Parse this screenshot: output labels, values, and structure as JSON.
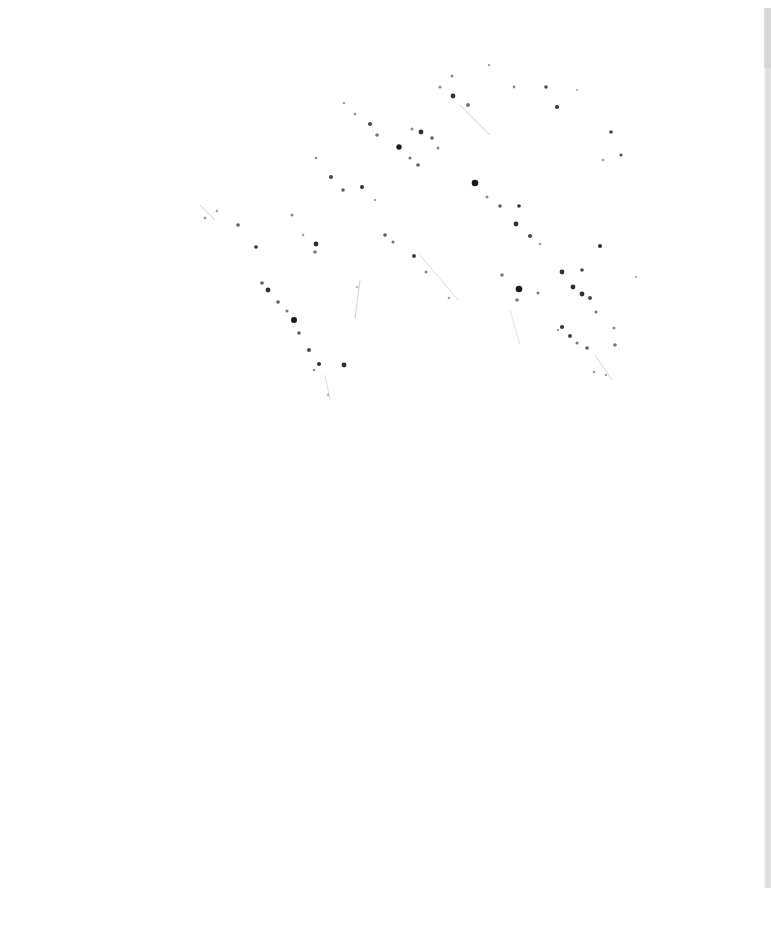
{
  "page": {
    "background": "#ffffff",
    "edge_color": "#dcdcdc",
    "ink_color": "#1a1a1a",
    "content_note": "Blank scanned page with faint ink bleed-through speckles; no legible text"
  },
  "speckles": [
    {
      "x": 452,
      "y": 76,
      "r": 1.5,
      "o": 0.5
    },
    {
      "x": 489,
      "y": 65,
      "r": 1.2,
      "o": 0.4
    },
    {
      "x": 514,
      "y": 87,
      "r": 1.4,
      "o": 0.5
    },
    {
      "x": 546,
      "y": 87,
      "r": 1.8,
      "o": 0.8
    },
    {
      "x": 557,
      "y": 107,
      "r": 2.0,
      "o": 0.9
    },
    {
      "x": 577,
      "y": 90,
      "r": 1.2,
      "o": 0.3
    },
    {
      "x": 440,
      "y": 87,
      "r": 1.5,
      "o": 0.5
    },
    {
      "x": 453,
      "y": 96,
      "r": 2.4,
      "o": 0.9
    },
    {
      "x": 468,
      "y": 105,
      "r": 2.0,
      "o": 0.6
    },
    {
      "x": 344,
      "y": 103,
      "r": 1.2,
      "o": 0.4
    },
    {
      "x": 355,
      "y": 114,
      "r": 1.3,
      "o": 0.5
    },
    {
      "x": 370,
      "y": 124,
      "r": 2.0,
      "o": 0.8
    },
    {
      "x": 377,
      "y": 135,
      "r": 1.8,
      "o": 0.6
    },
    {
      "x": 399,
      "y": 147,
      "r": 2.7,
      "o": 1.0
    },
    {
      "x": 412,
      "y": 129,
      "r": 1.5,
      "o": 0.5
    },
    {
      "x": 421,
      "y": 132,
      "r": 2.4,
      "o": 0.9
    },
    {
      "x": 432,
      "y": 138,
      "r": 1.8,
      "o": 0.7
    },
    {
      "x": 438,
      "y": 148,
      "r": 1.5,
      "o": 0.5
    },
    {
      "x": 410,
      "y": 158,
      "r": 1.6,
      "o": 0.6
    },
    {
      "x": 418,
      "y": 165,
      "r": 1.8,
      "o": 0.7
    },
    {
      "x": 611,
      "y": 132,
      "r": 1.8,
      "o": 0.8
    },
    {
      "x": 621,
      "y": 155,
      "r": 1.5,
      "o": 0.8
    },
    {
      "x": 603,
      "y": 160,
      "r": 1.3,
      "o": 0.4
    },
    {
      "x": 316,
      "y": 158,
      "r": 1.3,
      "o": 0.5
    },
    {
      "x": 331,
      "y": 177,
      "r": 2.0,
      "o": 0.8
    },
    {
      "x": 343,
      "y": 190,
      "r": 1.8,
      "o": 0.7
    },
    {
      "x": 362,
      "y": 187,
      "r": 2.0,
      "o": 0.9
    },
    {
      "x": 375,
      "y": 200,
      "r": 1.3,
      "o": 0.4
    },
    {
      "x": 475,
      "y": 183,
      "r": 3.3,
      "o": 1.0
    },
    {
      "x": 487,
      "y": 197,
      "r": 1.5,
      "o": 0.5
    },
    {
      "x": 500,
      "y": 206,
      "r": 1.8,
      "o": 0.7
    },
    {
      "x": 519,
      "y": 206,
      "r": 1.8,
      "o": 0.9
    },
    {
      "x": 516,
      "y": 224,
      "r": 2.4,
      "o": 0.9
    },
    {
      "x": 530,
      "y": 236,
      "r": 2.0,
      "o": 0.8
    },
    {
      "x": 540,
      "y": 244,
      "r": 1.3,
      "o": 0.4
    },
    {
      "x": 600,
      "y": 246,
      "r": 2.0,
      "o": 0.9
    },
    {
      "x": 205,
      "y": 218,
      "r": 1.5,
      "o": 0.4
    },
    {
      "x": 217,
      "y": 211,
      "r": 1.3,
      "o": 0.4
    },
    {
      "x": 238,
      "y": 225,
      "r": 1.8,
      "o": 0.7
    },
    {
      "x": 256,
      "y": 247,
      "r": 1.8,
      "o": 0.9
    },
    {
      "x": 292,
      "y": 215,
      "r": 1.5,
      "o": 0.5
    },
    {
      "x": 303,
      "y": 235,
      "r": 1.3,
      "o": 0.4
    },
    {
      "x": 316,
      "y": 244,
      "r": 2.4,
      "o": 0.9
    },
    {
      "x": 315,
      "y": 252,
      "r": 1.8,
      "o": 0.6
    },
    {
      "x": 385,
      "y": 235,
      "r": 1.8,
      "o": 0.7
    },
    {
      "x": 393,
      "y": 242,
      "r": 1.5,
      "o": 0.6
    },
    {
      "x": 414,
      "y": 256,
      "r": 2.0,
      "o": 0.8
    },
    {
      "x": 426,
      "y": 272,
      "r": 1.5,
      "o": 0.5
    },
    {
      "x": 262,
      "y": 283,
      "r": 1.8,
      "o": 0.7
    },
    {
      "x": 268,
      "y": 290,
      "r": 2.4,
      "o": 0.9
    },
    {
      "x": 278,
      "y": 302,
      "r": 1.8,
      "o": 0.7
    },
    {
      "x": 287,
      "y": 311,
      "r": 1.5,
      "o": 0.6
    },
    {
      "x": 294,
      "y": 320,
      "r": 3.0,
      "o": 1.0
    },
    {
      "x": 299,
      "y": 333,
      "r": 1.8,
      "o": 0.7
    },
    {
      "x": 309,
      "y": 350,
      "r": 2.0,
      "o": 0.8
    },
    {
      "x": 319,
      "y": 364,
      "r": 2.0,
      "o": 0.9
    },
    {
      "x": 314,
      "y": 370,
      "r": 1.3,
      "o": 0.5
    },
    {
      "x": 344,
      "y": 365,
      "r": 2.4,
      "o": 0.9
    },
    {
      "x": 328,
      "y": 395,
      "r": 1.2,
      "o": 0.3
    },
    {
      "x": 357,
      "y": 287,
      "r": 1.2,
      "o": 0.3
    },
    {
      "x": 502,
      "y": 275,
      "r": 1.8,
      "o": 0.6
    },
    {
      "x": 519,
      "y": 289,
      "r": 3.3,
      "o": 1.0
    },
    {
      "x": 517,
      "y": 300,
      "r": 1.8,
      "o": 0.6
    },
    {
      "x": 538,
      "y": 293,
      "r": 1.5,
      "o": 0.6
    },
    {
      "x": 562,
      "y": 272,
      "r": 2.4,
      "o": 0.9
    },
    {
      "x": 582,
      "y": 270,
      "r": 1.8,
      "o": 0.8
    },
    {
      "x": 573,
      "y": 287,
      "r": 2.4,
      "o": 0.9
    },
    {
      "x": 582,
      "y": 294,
      "r": 2.4,
      "o": 0.9
    },
    {
      "x": 590,
      "y": 298,
      "r": 2.0,
      "o": 0.8
    },
    {
      "x": 596,
      "y": 312,
      "r": 1.5,
      "o": 0.6
    },
    {
      "x": 562,
      "y": 327,
      "r": 2.0,
      "o": 0.9
    },
    {
      "x": 570,
      "y": 336,
      "r": 2.0,
      "o": 0.8
    },
    {
      "x": 577,
      "y": 343,
      "r": 1.5,
      "o": 0.6
    },
    {
      "x": 587,
      "y": 348,
      "r": 1.8,
      "o": 0.7
    },
    {
      "x": 614,
      "y": 328,
      "r": 1.5,
      "o": 0.5
    },
    {
      "x": 615,
      "y": 345,
      "r": 1.8,
      "o": 0.6
    },
    {
      "x": 606,
      "y": 375,
      "r": 1.3,
      "o": 0.4
    },
    {
      "x": 636,
      "y": 277,
      "r": 1.2,
      "o": 0.3
    },
    {
      "x": 594,
      "y": 372,
      "r": 1.3,
      "o": 0.4
    },
    {
      "x": 558,
      "y": 330,
      "r": 1.3,
      "o": 0.4
    },
    {
      "x": 449,
      "y": 298,
      "r": 1.3,
      "o": 0.4
    }
  ],
  "strokes": [
    {
      "x1": 460,
      "y1": 105,
      "x2": 490,
      "y2": 135,
      "o": 0.18
    },
    {
      "x1": 360,
      "y1": 280,
      "x2": 355,
      "y2": 318,
      "o": 0.2
    },
    {
      "x1": 420,
      "y1": 255,
      "x2": 458,
      "y2": 300,
      "o": 0.15
    },
    {
      "x1": 510,
      "y1": 310,
      "x2": 520,
      "y2": 345,
      "o": 0.12
    },
    {
      "x1": 595,
      "y1": 355,
      "x2": 612,
      "y2": 380,
      "o": 0.18
    },
    {
      "x1": 200,
      "y1": 205,
      "x2": 215,
      "y2": 220,
      "o": 0.2
    },
    {
      "x1": 325,
      "y1": 375,
      "x2": 330,
      "y2": 400,
      "o": 0.15
    }
  ]
}
